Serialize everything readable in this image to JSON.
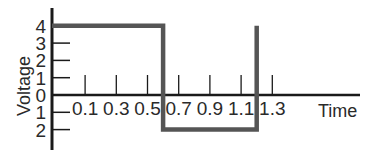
{
  "chart_data": {
    "type": "line",
    "title": "",
    "xlabel": "Time",
    "ylabel": "Voltage",
    "x_ticks": [
      "0.1",
      "0.3",
      "0.5",
      "0.7",
      "0.9",
      "1.1",
      "1.3"
    ],
    "x_tick_values": [
      0.1,
      0.3,
      0.5,
      0.7,
      0.9,
      1.1,
      1.3
    ],
    "y_ticks": [
      "4",
      "3",
      "2",
      "1",
      "0",
      "1",
      "2"
    ],
    "y_tick_values": [
      4,
      3,
      2,
      1,
      0,
      -1,
      -2
    ],
    "xlim": [
      0,
      1.5
    ],
    "ylim": [
      -2.5,
      4.5
    ],
    "grid": false,
    "legend": null,
    "series": [
      {
        "name": "square wave",
        "x": [
          0,
          0.6,
          0.6,
          1.2,
          1.2
        ],
        "y": [
          4,
          4,
          -2,
          -2,
          4
        ]
      }
    ],
    "colors": {
      "axis": "#1a1a1a",
      "waveform": "#555555",
      "text": "#2a2a2a"
    }
  }
}
